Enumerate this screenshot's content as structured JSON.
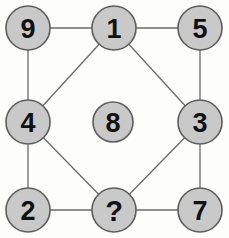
{
  "diagram": {
    "background_color": "#fdfdfc",
    "node_fill_color": "#c9c9c9",
    "node_stroke_color": "#5d5d5d",
    "edge_color": "#6a6a6a",
    "label_color": "#111111",
    "nodes": [
      {
        "id": "n9",
        "label": "9",
        "x": 28,
        "y": 28,
        "r": 22,
        "position": "top-left"
      },
      {
        "id": "n1",
        "label": "1",
        "x": 114,
        "y": 28,
        "r": 22,
        "position": "top-center"
      },
      {
        "id": "n5",
        "label": "5",
        "x": 200,
        "y": 28,
        "r": 22,
        "position": "top-right"
      },
      {
        "id": "n4",
        "label": "4",
        "x": 28,
        "y": 122,
        "r": 22,
        "position": "middle-left"
      },
      {
        "id": "n8",
        "label": "8",
        "x": 113,
        "y": 122,
        "r": 20,
        "position": "center"
      },
      {
        "id": "n3",
        "label": "3",
        "x": 200,
        "y": 122,
        "r": 22,
        "position": "middle-right"
      },
      {
        "id": "n2",
        "label": "2",
        "x": 28,
        "y": 210,
        "r": 22,
        "position": "bottom-left"
      },
      {
        "id": "nunknown",
        "label": "?",
        "x": 114,
        "y": 210,
        "r": 22,
        "position": "bottom-center"
      },
      {
        "id": "n7",
        "label": "7",
        "x": 200,
        "y": 210,
        "r": 22,
        "position": "bottom-right"
      }
    ],
    "edges": [
      {
        "from": "n9",
        "to": "n1",
        "kind": "horizontal"
      },
      {
        "from": "n1",
        "to": "n5",
        "kind": "horizontal"
      },
      {
        "from": "n9",
        "to": "n4",
        "kind": "vertical"
      },
      {
        "from": "n4",
        "to": "n2",
        "kind": "vertical"
      },
      {
        "from": "n5",
        "to": "n3",
        "kind": "vertical"
      },
      {
        "from": "n3",
        "to": "n7",
        "kind": "vertical"
      },
      {
        "from": "n2",
        "to": "nunknown",
        "kind": "horizontal"
      },
      {
        "from": "nunknown",
        "to": "n7",
        "kind": "horizontal"
      },
      {
        "from": "n4",
        "to": "n1",
        "kind": "diagonal"
      },
      {
        "from": "n1",
        "to": "n3",
        "kind": "diagonal"
      },
      {
        "from": "n4",
        "to": "nunknown",
        "kind": "diagonal"
      },
      {
        "from": "nunknown",
        "to": "n3",
        "kind": "diagonal"
      }
    ]
  }
}
